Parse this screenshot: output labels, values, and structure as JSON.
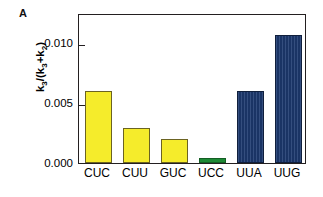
{
  "panel": {
    "label": "A"
  },
  "chart_data": {
    "type": "bar",
    "title": "",
    "subtitle": "",
    "xlabel": "",
    "ylabel": "k3/(k3+k2)",
    "ylabel_parts": {
      "base1": "k",
      "sub1": "3",
      "mid": "/(k",
      "sub2": "3",
      "plus": "+k",
      "sub3": "2",
      "close": ")"
    },
    "categories": [
      "CUC",
      "CUU",
      "GUC",
      "UCC",
      "UUA",
      "UUG"
    ],
    "values": [
      0.006,
      0.0029,
      0.002,
      0.0004,
      0.006,
      0.0107
    ],
    "bar_colors": [
      "#f5ec2b",
      "#f5ec2b",
      "#f5ec2b",
      "#1d8a35",
      "#1d3a70",
      "#1d3a70"
    ],
    "bar_color_groups": [
      "yellow",
      "yellow",
      "yellow",
      "green",
      "blue",
      "blue"
    ],
    "ylim": [
      0.0,
      0.0125
    ],
    "yticks": [
      0.0,
      0.005,
      0.01
    ],
    "ytick_labels": [
      "0.000",
      "0.005",
      "0.010"
    ],
    "grid": false,
    "legend": null,
    "legend_position": "none",
    "annotations": []
  },
  "style": {
    "background": "#ffffff",
    "axis_color": "#231f20",
    "yellow": "#f5ec2b",
    "yellow_edge": "#6b6322",
    "green": "#1d8a35",
    "green_edge": "#145e24",
    "blue": "#1d3a70",
    "blue_edge": "#101f3c"
  }
}
